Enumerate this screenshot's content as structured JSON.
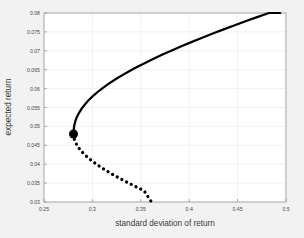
{
  "chart_data": {
    "type": "line",
    "title": "",
    "xlabel": "standard deviation of return",
    "ylabel": "expected return",
    "xlim": [
      0.25,
      0.5
    ],
    "ylim": [
      0.03,
      0.08
    ],
    "xticks": [
      "0.25",
      "0.3",
      "0.35",
      "0.4",
      "0.45",
      "0.5"
    ],
    "xtick_values": [
      0.25,
      0.3,
      0.35,
      0.4,
      0.45,
      0.5
    ],
    "yticks": [
      "0.03",
      "0.035",
      "0.04",
      "0.045",
      "0.05",
      "0.055",
      "0.06",
      "0.065",
      "0.07",
      "0.075",
      "0.08"
    ],
    "ytick_values": [
      0.03,
      0.035,
      0.04,
      0.045,
      0.05,
      0.055,
      0.06,
      0.065,
      0.07,
      0.075,
      0.08
    ],
    "grid": true,
    "legend": "none",
    "series": [
      {
        "name": "efficient frontier",
        "style": "solid",
        "color": "#000000",
        "linewidth": 2.2,
        "points": [
          [
            0.2805,
            0.048
          ],
          [
            0.2807,
            0.0492
          ],
          [
            0.2813,
            0.0503
          ],
          [
            0.2824,
            0.0514
          ],
          [
            0.284,
            0.0525
          ],
          [
            0.2862,
            0.0536
          ],
          [
            0.2889,
            0.0547
          ],
          [
            0.2922,
            0.0558
          ],
          [
            0.296,
            0.0569
          ],
          [
            0.3004,
            0.058
          ],
          [
            0.3054,
            0.0591
          ],
          [
            0.3109,
            0.0602
          ],
          [
            0.3169,
            0.0613
          ],
          [
            0.3235,
            0.0624
          ],
          [
            0.3305,
            0.0635
          ],
          [
            0.338,
            0.0646
          ],
          [
            0.346,
            0.0657
          ],
          [
            0.3544,
            0.0668
          ],
          [
            0.3632,
            0.0679
          ],
          [
            0.3724,
            0.069
          ],
          [
            0.382,
            0.0701
          ],
          [
            0.3919,
            0.0712
          ],
          [
            0.4022,
            0.0723
          ],
          [
            0.4128,
            0.0734
          ],
          [
            0.4237,
            0.0745
          ],
          [
            0.4349,
            0.0756
          ],
          [
            0.4464,
            0.0767
          ],
          [
            0.4581,
            0.0778
          ],
          [
            0.4701,
            0.0789
          ],
          [
            0.4823,
            0.08
          ],
          [
            0.494,
            0.08
          ]
        ]
      },
      {
        "name": "inefficient frontier",
        "style": "dotted",
        "color": "#000000",
        "linewidth": 2.6,
        "points": [
          [
            0.2805,
            0.048
          ],
          [
            0.2809,
            0.047
          ],
          [
            0.2821,
            0.046
          ],
          [
            0.2841,
            0.045
          ],
          [
            0.2868,
            0.044
          ],
          [
            0.2902,
            0.043
          ],
          [
            0.2943,
            0.042
          ],
          [
            0.299,
            0.041
          ],
          [
            0.3042,
            0.04
          ],
          [
            0.31,
            0.039
          ],
          [
            0.3163,
            0.038
          ],
          [
            0.323,
            0.037
          ],
          [
            0.3301,
            0.036
          ],
          [
            0.3375,
            0.035
          ],
          [
            0.3453,
            0.034
          ],
          [
            0.3533,
            0.033
          ],
          [
            0.361,
            0.03
          ]
        ]
      }
    ],
    "markers": [
      {
        "name": "minimum-variance-point",
        "x": 0.2805,
        "y": 0.048,
        "size": 9,
        "color": "#000000"
      }
    ]
  },
  "figure": {
    "background_color": "#f2f2f2",
    "axes_background_color": "#ffffff",
    "axis_color": "#9a9a9a",
    "grid_color": "#eaeaea",
    "text_color": "#3a3a3a"
  }
}
